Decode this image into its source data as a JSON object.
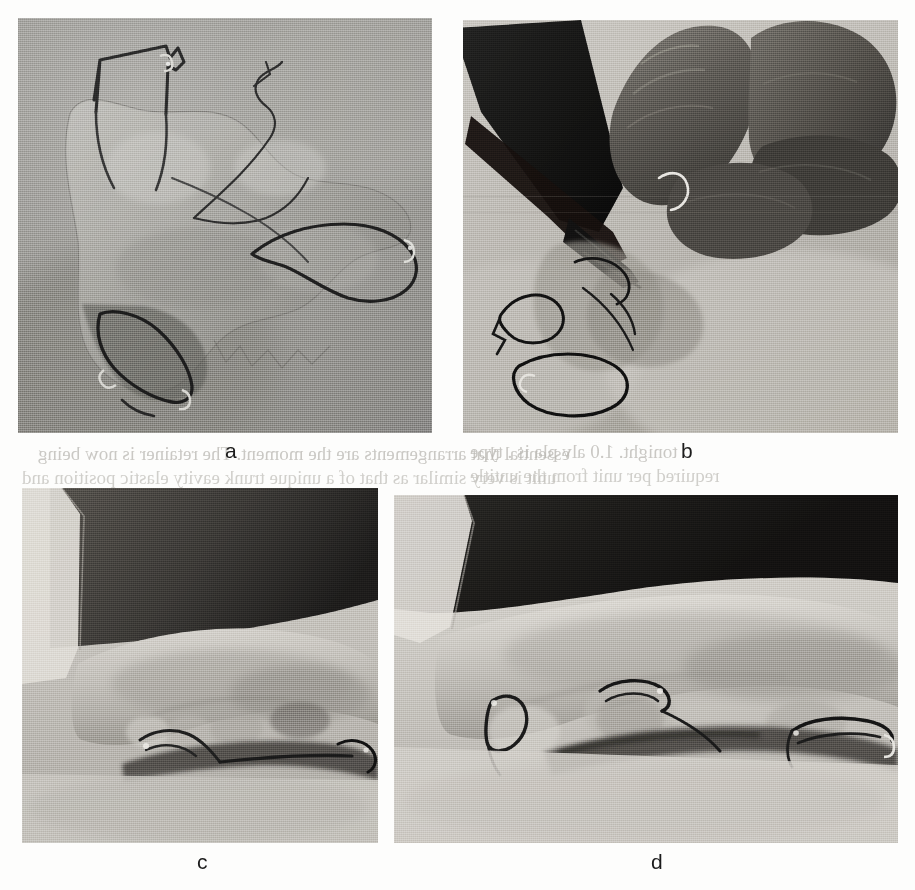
{
  "figure": {
    "type": "photographic-plate",
    "layout": "2x2",
    "background_color": "#fdfdfc",
    "panel_count": 4,
    "color_mode": "grayscale"
  },
  "panels": [
    {
      "id": "a",
      "caption": "a",
      "subject": "clear acrylic removable orthodontic appliance with stainless steel wire clasps, occlusal view on gray background",
      "x": 18,
      "y": 18,
      "width": 414,
      "height": 415,
      "base_color": "#9a9a98",
      "plate_color": "#a8a7a2",
      "wire_color": "#2c2c2c"
    },
    {
      "id": "b",
      "caption": "b",
      "subject": "gloved hands using pliers to adjust a wire clasp on the acrylic appliance",
      "x": 463,
      "y": 20,
      "width": 435,
      "height": 413,
      "base_color": "#b9b6b0",
      "plate_color": "#8e8b86",
      "wire_color": "#1a1a1a"
    },
    {
      "id": "c",
      "caption": "c",
      "subject": "dental stone cast, lateral view, with wire element seated along the buccal surface",
      "x": 22,
      "y": 488,
      "width": 356,
      "height": 355,
      "base_color": "#bdbab4",
      "plate_color": "#a6a39d",
      "wire_color": "#232323"
    },
    {
      "id": "d",
      "caption": "d",
      "subject": "dental stone cast, lateral view at higher magnification, showing three wire retention elements",
      "x": 394,
      "y": 495,
      "width": 504,
      "height": 348,
      "base_color": "#c6c3bd",
      "plate_color": "#b0ada7",
      "wire_color": "#1e1e1e"
    }
  ],
  "captions": [
    {
      "label": "a",
      "x": 225,
      "y": 440
    },
    {
      "label": "b",
      "x": 681,
      "y": 440
    },
    {
      "label": "c",
      "x": 197,
      "y": 851
    },
    {
      "label": "d",
      "x": 651,
      "y": 851
    }
  ],
  "bleed_through_text": {
    "note": "faint mirrored show-through text from the reverse side of the scanned page",
    "lines": [
      {
        "text": "essential that arrangements are the moment. The retainer is now being",
        "x": 38,
        "y": 448
      },
      {
        "text": "unit is very similar as that of a unique  trunk      eavity elastic position and",
        "x": 30,
        "y": 472
      },
      {
        "text": "tonight. 1.0 alv pla is    .    type",
        "x": 500,
        "y": 446
      },
      {
        "text": "required per unit from the untitle",
        "x": 500,
        "y": 470
      }
    ]
  }
}
